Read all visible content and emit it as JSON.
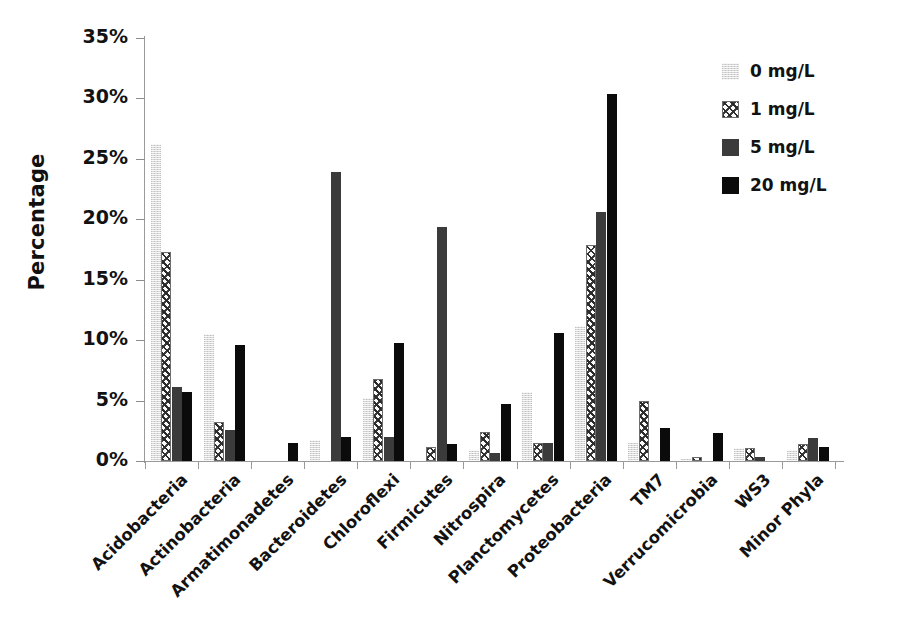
{
  "chart_data": {
    "type": "bar",
    "title": "",
    "xlabel": "",
    "ylabel": "Percentage",
    "ylim": [
      0,
      35
    ],
    "ytick_labels": [
      "0%",
      "5%",
      "10%",
      "15%",
      "20%",
      "25%",
      "30%",
      "35%"
    ],
    "ytick_values": [
      0,
      5,
      10,
      15,
      20,
      25,
      30,
      35
    ],
    "grid": false,
    "legend_position": "top-right",
    "units": "percent",
    "categories": [
      "Acidobacteria",
      "Actinobacteria",
      "Armatimonadetes",
      "Bacteroidetes",
      "Chloroflexi",
      "Firmicutes",
      "Nitrospira",
      "Planctomycetes",
      "Proteobacteria",
      "TM7",
      "Verrucomicrobia",
      "WS3",
      "Minor Phyla"
    ],
    "series": [
      {
        "name": "0 mg/L",
        "fill": "light-grey",
        "color": "#d8d8d8",
        "values": [
          26.2,
          10.5,
          0.0,
          1.7,
          5.2,
          0.0,
          0.9,
          5.7,
          11.2,
          1.5,
          0.2,
          1.1,
          0.9
        ]
      },
      {
        "name": "1 mg/L",
        "fill": "speckled",
        "color": "#fbfbfb",
        "values": [
          17.3,
          3.2,
          0.0,
          0.0,
          6.8,
          1.2,
          2.4,
          1.5,
          17.9,
          5.0,
          0.3,
          1.1,
          1.4
        ]
      },
      {
        "name": "5 mg/L",
        "fill": "dark-grey",
        "color": "#3b3b3b",
        "values": [
          6.1,
          2.6,
          0.0,
          23.9,
          2.0,
          19.4,
          0.7,
          1.5,
          20.6,
          0.0,
          0.0,
          0.3,
          1.9
        ]
      },
      {
        "name": "20 mg/L",
        "fill": "black",
        "color": "#0b0b0b",
        "values": [
          5.7,
          9.6,
          1.5,
          2.0,
          9.8,
          1.4,
          4.7,
          10.6,
          30.4,
          2.7,
          2.3,
          0.0,
          1.2
        ]
      }
    ]
  },
  "legend": {
    "items": [
      {
        "label": "0 mg/L"
      },
      {
        "label": "1 mg/L"
      },
      {
        "label": "5 mg/L"
      },
      {
        "label": "20 mg/L"
      }
    ]
  },
  "axes": {
    "y_title": "Percentage"
  }
}
